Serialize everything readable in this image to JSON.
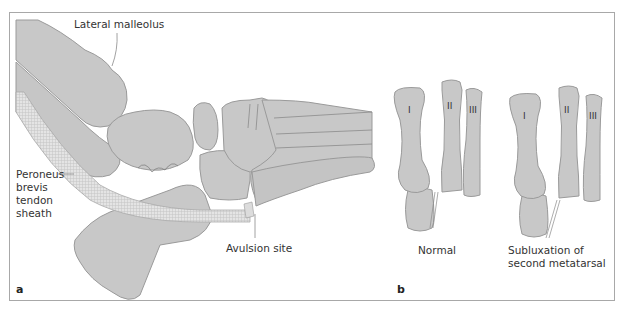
{
  "figure": {
    "panel_a": {
      "letter": "a",
      "labels": {
        "lateral_malleolus": "Lateral malleolus",
        "peroneus_line1": "Peroneus",
        "peroneus_line2": "brevis",
        "peroneus_line3": "tendon",
        "peroneus_line4": "sheath",
        "avulsion_site": "Avulsion site"
      }
    },
    "panel_b": {
      "letter": "b",
      "normal": {
        "caption": "Normal",
        "metatarsals": [
          "I",
          "II",
          "III"
        ]
      },
      "subluxation": {
        "caption_line1": "Subluxation of",
        "caption_line2": "second metatarsal",
        "metatarsals": [
          "I",
          "II",
          "III"
        ]
      }
    },
    "colors": {
      "bone_fill": "#c8c8c8",
      "bone_outline": "#9a9a9a",
      "tendon_fill": "#e6e6e6",
      "frame": "#a8a8a8",
      "text": "#333333"
    }
  }
}
